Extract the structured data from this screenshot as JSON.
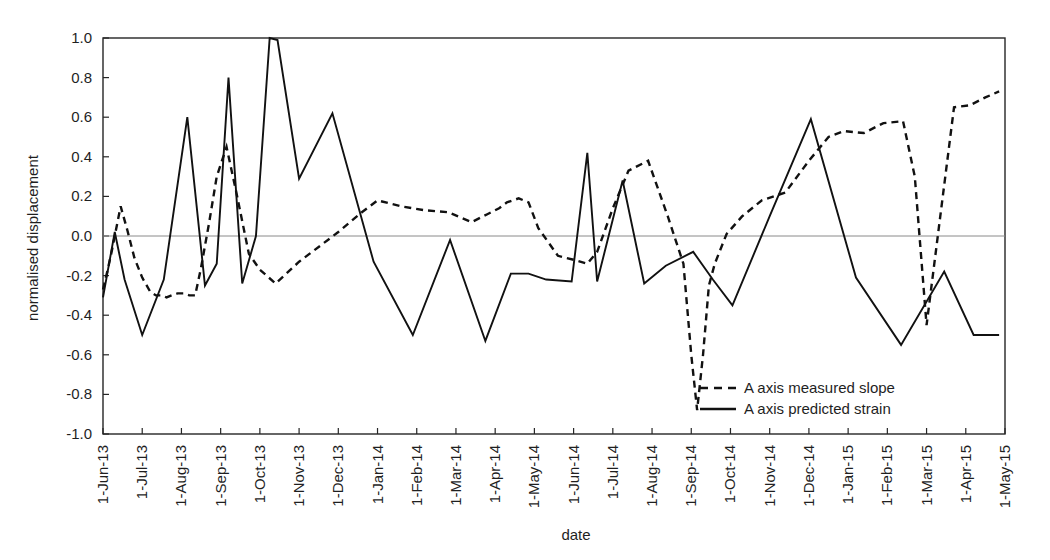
{
  "chart_data": {
    "type": "line",
    "title": "",
    "xlabel": "date",
    "ylabel": "normalised displacement",
    "ylim": [
      -1.0,
      1.0
    ],
    "ytick_labels": [
      "1.0",
      "0.8",
      "0.6",
      "0.4",
      "0.2",
      "0.0",
      "-0.2",
      "-0.4",
      "-0.6",
      "-0.8",
      "-1.0"
    ],
    "ytick_values": [
      1.0,
      0.8,
      0.6,
      0.4,
      0.2,
      0.0,
      -0.2,
      -0.4,
      -0.6,
      -0.8,
      -1.0
    ],
    "grid": false,
    "zero_line": true,
    "legend_position": "inside-bottom-right",
    "categories": [
      "1-Jun-13",
      "1-Jul-13",
      "1-Aug-13",
      "1-Sep-13",
      "1-Oct-13",
      "1-Nov-13",
      "1-Dec-13",
      "1-Jan-14",
      "1-Feb-14",
      "1-Mar-14",
      "1-Apr-14",
      "1-May-14",
      "1-Jun-14",
      "1-Jul-14",
      "1-Aug-14",
      "1-Sep-14",
      "1-Oct-14",
      "1-Nov-14",
      "1-Dec-14",
      "1-Jan-15",
      "1-Feb-15",
      "1-Mar-15",
      "1-Apr-15",
      "1-May-15"
    ],
    "x_axis_start": "1-Jun-13",
    "x_axis_end": "1-May-15",
    "series": [
      {
        "name": "A axis measured slope",
        "style": "dashed",
        "color": "#111111",
        "x": [
          1.0,
          1.12,
          1.22,
          1.32,
          1.45,
          1.62,
          1.8,
          2.0,
          2.2,
          2.35,
          2.5,
          2.62,
          2.75,
          2.9,
          3.05,
          3.2,
          3.35,
          3.5,
          3.7,
          3.9,
          4.15,
          4.4,
          4.72,
          5.0,
          5.4,
          6.0,
          6.6,
          7.0,
          7.6,
          8.0,
          8.6,
          9.2,
          9.8,
          10.4,
          10.8,
          11.1,
          11.3,
          11.6,
          11.85,
          12.1,
          12.6,
          13.0,
          13.35,
          13.6,
          14.0,
          14.4,
          14.9,
          15.4,
          15.8,
          16.0,
          16.15,
          16.3,
          16.45,
          16.6,
          16.9,
          17.3,
          17.8,
          18.4,
          19.0,
          19.5,
          19.9,
          20.4,
          20.9,
          21.4,
          21.7,
          22.0,
          22.35,
          22.7,
          23.1,
          23.5,
          23.85
        ],
        "y": [
          -0.27,
          -0.17,
          -0.08,
          0.02,
          0.15,
          0.03,
          -0.11,
          -0.21,
          -0.28,
          -0.3,
          -0.3,
          -0.31,
          -0.3,
          -0.29,
          -0.29,
          -0.3,
          -0.3,
          -0.16,
          0.06,
          0.3,
          0.45,
          0.22,
          -0.09,
          -0.17,
          -0.24,
          -0.13,
          -0.04,
          0.02,
          0.12,
          0.18,
          0.15,
          0.13,
          0.12,
          0.07,
          0.11,
          0.14,
          0.17,
          0.19,
          0.17,
          0.04,
          -0.1,
          -0.12,
          -0.14,
          -0.08,
          0.14,
          0.33,
          0.38,
          0.1,
          -0.14,
          -0.6,
          -0.88,
          -0.6,
          -0.25,
          -0.14,
          0.01,
          0.1,
          0.18,
          0.22,
          0.38,
          0.5,
          0.53,
          0.52,
          0.57,
          0.58,
          0.3,
          -0.45,
          0.1,
          0.65,
          0.66,
          0.7,
          0.73
        ],
        "x2": [
          24.0,
          24.5,
          25.0
        ]
      },
      {
        "name": "A axis predicted strain",
        "style": "solid",
        "color": "#111111",
        "x": [
          1.0,
          1.3,
          1.55,
          2.0,
          2.55,
          3.15,
          3.6,
          3.9,
          4.2,
          4.55,
          4.9,
          5.25,
          5.45,
          6.0,
          6.85,
          7.9,
          8.9,
          9.85,
          10.75,
          11.4,
          11.85,
          12.3,
          12.95,
          13.35,
          13.6,
          14.25,
          14.8,
          15.35,
          16.05,
          16.55,
          17.05,
          18.0,
          19.05,
          20.2,
          21.35,
          22.45,
          23.2,
          23.85
        ],
        "y": [
          -0.31,
          0.02,
          -0.22,
          -0.5,
          -0.22,
          0.6,
          -0.25,
          -0.14,
          0.8,
          -0.24,
          0.0,
          1.0,
          0.99,
          0.29,
          0.62,
          -0.13,
          -0.5,
          -0.02,
          -0.53,
          -0.19,
          -0.19,
          -0.22,
          -0.23,
          0.42,
          -0.23,
          0.28,
          -0.24,
          -0.15,
          -0.08,
          -0.22,
          -0.35,
          0.1,
          0.59,
          -0.21,
          -0.55,
          -0.18,
          -0.5,
          -0.5
        ]
      }
    ],
    "legend": [
      {
        "label": "A axis measured slope",
        "style": "dashed"
      },
      {
        "label": "A axis predicted strain",
        "style": "solid"
      }
    ]
  },
  "axis": {
    "ylabel": "normalised displacement",
    "xlabel": "date"
  }
}
